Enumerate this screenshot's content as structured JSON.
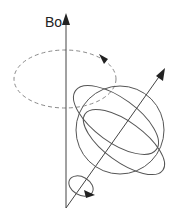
{
  "diagram": {
    "labels": {
      "field": "Bo"
    },
    "colors": {
      "stroke": "#3a3a3a",
      "dashed": "#8a8a8a",
      "background": "#ffffff"
    },
    "elements": [
      {
        "name": "field-axis",
        "type": "arrow",
        "from": [
          66,
          208
        ],
        "to": [
          66,
          14
        ]
      },
      {
        "name": "precession-path",
        "type": "dashed-ellipse",
        "center": [
          65,
          79
        ],
        "rx": 51,
        "ry": 29
      },
      {
        "name": "spin-axis",
        "type": "arrow",
        "from": [
          66,
          208
        ],
        "to": [
          165,
          68
        ]
      },
      {
        "name": "nucleus-sphere",
        "type": "sphere",
        "center": [
          120,
          130
        ],
        "r": 44
      },
      {
        "name": "spin-rotation-loop",
        "type": "ellipse",
        "center": [
          82,
          187
        ],
        "rx": 14,
        "ry": 9
      }
    ]
  }
}
